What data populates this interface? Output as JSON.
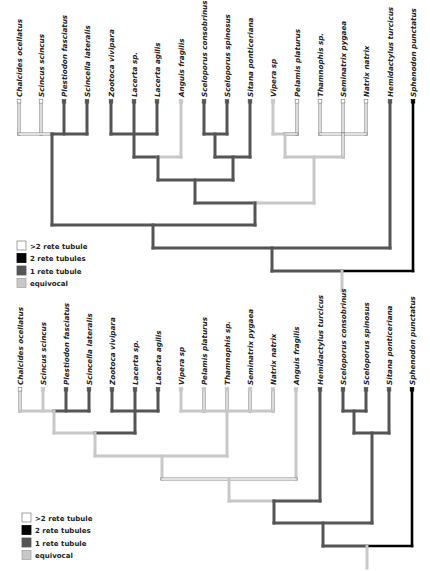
{
  "figure": {
    "caption_fragment": "...ology and ... of ... rete tubule ... (cropped header)",
    "states": {
      "gt2": {
        "label": ">2 rete tubule",
        "color": "#ffffff",
        "stroke": "#8a8a8a"
      },
      "two": {
        "label": "2 rete tubules",
        "color": "#000000",
        "stroke": "#000000"
      },
      "one": {
        "label": "1 rete tubule",
        "color": "#555555",
        "stroke": "#555555"
      },
      "equivocal": {
        "label": "equivocal",
        "color": "#c8c8c8",
        "stroke": "#c8c8c8"
      }
    },
    "legend_order": [
      "gt2",
      "two",
      "one",
      "equivocal"
    ],
    "panels": [
      {
        "id": "top",
        "tip_y": 103,
        "label_y": 100,
        "legend": {
          "x": 17,
          "y": 241
        },
        "root": {
          "x": 341,
          "y": 288
        },
        "taxa": [
          {
            "name": "Chalcides ocellatus",
            "x": 19,
            "state": "gt2"
          },
          {
            "name": "Scincus scincus",
            "x": 41,
            "state": "gt2"
          },
          {
            "name": "Plestiodon fasciatus",
            "x": 64,
            "state": "one"
          },
          {
            "name": "Scincella lateralis",
            "x": 87,
            "state": "one"
          },
          {
            "name": "Zootoca vivipara",
            "x": 111,
            "state": "one"
          },
          {
            "name": "Lacerta sp.",
            "x": 134,
            "state": "one"
          },
          {
            "name": "Lacerta agilis",
            "x": 157,
            "state": "one"
          },
          {
            "name": "Anguis fragilis",
            "x": 181,
            "state": "equivocal"
          },
          {
            "name": "Sceloporus consobrinus",
            "x": 204,
            "state": "one"
          },
          {
            "name": "Sceloporus spinosus",
            "x": 227,
            "state": "one"
          },
          {
            "name": "Sitana ponticeriana",
            "x": 250,
            "state": "one"
          },
          {
            "name": "Vipera sp",
            "x": 273,
            "state": "equivocal"
          },
          {
            "name": "Pelamis platurus",
            "x": 297,
            "state": "gt2"
          },
          {
            "name": "Thamnophis sp.",
            "x": 320,
            "state": "gt2"
          },
          {
            "name": "Seminatrix pygaea",
            "x": 343,
            "state": "gt2"
          },
          {
            "name": "Natrix natrix",
            "x": 366,
            "state": "gt2"
          },
          {
            "name": "Hemidactylus turcicus",
            "x": 390,
            "state": "one"
          },
          {
            "name": "Sphenodon punctatus",
            "x": 413,
            "state": "two"
          }
        ],
        "edges": [
          {
            "x1": 19,
            "y1": 103,
            "x2": 19,
            "y2": 134,
            "s": "gt2"
          },
          {
            "x1": 41,
            "y1": 103,
            "x2": 41,
            "y2": 134,
            "s": "gt2"
          },
          {
            "x1": 19,
            "y1": 134,
            "x2": 52,
            "y2": 134,
            "s": "gt2"
          },
          {
            "x1": 64,
            "y1": 103,
            "x2": 64,
            "y2": 134,
            "s": "one"
          },
          {
            "x1": 87,
            "y1": 103,
            "x2": 87,
            "y2": 134,
            "s": "one"
          },
          {
            "x1": 52,
            "y1": 134,
            "x2": 87,
            "y2": 134,
            "s": "one"
          },
          {
            "x1": 52,
            "y1": 134,
            "x2": 52,
            "y2": 225,
            "s": "one"
          },
          {
            "x1": 111,
            "y1": 103,
            "x2": 111,
            "y2": 134,
            "s": "one"
          },
          {
            "x1": 157,
            "y1": 103,
            "x2": 157,
            "y2": 134,
            "s": "one"
          },
          {
            "x1": 111,
            "y1": 134,
            "x2": 157,
            "y2": 134,
            "s": "one"
          },
          {
            "x1": 134,
            "y1": 103,
            "x2": 134,
            "y2": 157,
            "s": "one"
          },
          {
            "x1": 181,
            "y1": 103,
            "x2": 181,
            "y2": 157,
            "s": "equivocal"
          },
          {
            "x1": 134,
            "y1": 157,
            "x2": 158,
            "y2": 157,
            "s": "one"
          },
          {
            "x1": 158,
            "y1": 157,
            "x2": 181,
            "y2": 157,
            "s": "equivocal"
          },
          {
            "x1": 158,
            "y1": 157,
            "x2": 158,
            "y2": 180,
            "s": "one"
          },
          {
            "x1": 204,
            "y1": 103,
            "x2": 204,
            "y2": 134,
            "s": "one"
          },
          {
            "x1": 227,
            "y1": 103,
            "x2": 227,
            "y2": 134,
            "s": "one"
          },
          {
            "x1": 204,
            "y1": 134,
            "x2": 227,
            "y2": 134,
            "s": "one"
          },
          {
            "x1": 215,
            "y1": 134,
            "x2": 215,
            "y2": 157,
            "s": "one"
          },
          {
            "x1": 250,
            "y1": 103,
            "x2": 250,
            "y2": 157,
            "s": "one"
          },
          {
            "x1": 215,
            "y1": 157,
            "x2": 250,
            "y2": 157,
            "s": "one"
          },
          {
            "x1": 233,
            "y1": 157,
            "x2": 233,
            "y2": 180,
            "s": "one"
          },
          {
            "x1": 158,
            "y1": 180,
            "x2": 233,
            "y2": 180,
            "s": "one"
          },
          {
            "x1": 195,
            "y1": 180,
            "x2": 195,
            "y2": 203,
            "s": "one"
          },
          {
            "x1": 273,
            "y1": 103,
            "x2": 273,
            "y2": 134,
            "s": "equivocal"
          },
          {
            "x1": 297,
            "y1": 103,
            "x2": 297,
            "y2": 134,
            "s": "gt2"
          },
          {
            "x1": 273,
            "y1": 134,
            "x2": 285,
            "y2": 134,
            "s": "equivocal"
          },
          {
            "x1": 285,
            "y1": 134,
            "x2": 297,
            "y2": 134,
            "s": "gt2"
          },
          {
            "x1": 320,
            "y1": 103,
            "x2": 320,
            "y2": 134,
            "s": "gt2"
          },
          {
            "x1": 343,
            "y1": 103,
            "x2": 343,
            "y2": 134,
            "s": "gt2"
          },
          {
            "x1": 366,
            "y1": 103,
            "x2": 366,
            "y2": 134,
            "s": "gt2"
          },
          {
            "x1": 320,
            "y1": 134,
            "x2": 366,
            "y2": 134,
            "s": "gt2"
          },
          {
            "x1": 285,
            "y1": 134,
            "x2": 285,
            "y2": 157,
            "s": "equivocal"
          },
          {
            "x1": 343,
            "y1": 134,
            "x2": 343,
            "y2": 157,
            "s": "gt2"
          },
          {
            "x1": 285,
            "y1": 157,
            "x2": 343,
            "y2": 157,
            "s": "equivocal"
          },
          {
            "x1": 314,
            "y1": 157,
            "x2": 314,
            "y2": 203,
            "s": "equivocal"
          },
          {
            "x1": 195,
            "y1": 203,
            "x2": 255,
            "y2": 203,
            "s": "one"
          },
          {
            "x1": 255,
            "y1": 203,
            "x2": 314,
            "y2": 203,
            "s": "equivocal"
          },
          {
            "x1": 255,
            "y1": 203,
            "x2": 255,
            "y2": 225,
            "s": "one"
          },
          {
            "x1": 52,
            "y1": 225,
            "x2": 255,
            "y2": 225,
            "s": "one"
          },
          {
            "x1": 153,
            "y1": 225,
            "x2": 153,
            "y2": 248,
            "s": "one"
          },
          {
            "x1": 390,
            "y1": 103,
            "x2": 390,
            "y2": 248,
            "s": "one"
          },
          {
            "x1": 153,
            "y1": 248,
            "x2": 390,
            "y2": 248,
            "s": "one"
          },
          {
            "x1": 272,
            "y1": 248,
            "x2": 272,
            "y2": 271,
            "s": "one"
          },
          {
            "x1": 413,
            "y1": 103,
            "x2": 413,
            "y2": 271,
            "s": "two"
          },
          {
            "x1": 272,
            "y1": 271,
            "x2": 342,
            "y2": 271,
            "s": "one"
          },
          {
            "x1": 342,
            "y1": 271,
            "x2": 413,
            "y2": 271,
            "s": "two"
          },
          {
            "x1": 342,
            "y1": 271,
            "x2": 342,
            "y2": 291,
            "s": "equivocal"
          }
        ]
      },
      {
        "id": "bottom",
        "tip_y": 391,
        "label_y": 388,
        "legend": {
          "x": 22,
          "y": 513
        },
        "root": {
          "x": 367,
          "y": 568
        },
        "taxa": [
          {
            "name": "Chalcides ocellatus",
            "x": 20,
            "state": "gt2"
          },
          {
            "name": "Scincus scincus",
            "x": 43,
            "state": "equivocal"
          },
          {
            "name": "Plestiodon fasciatus",
            "x": 66,
            "state": "one"
          },
          {
            "name": "Scincella lateralis",
            "x": 89,
            "state": "one"
          },
          {
            "name": "Zootoca vivipara",
            "x": 112,
            "state": "one"
          },
          {
            "name": "Lacerta sp.",
            "x": 135,
            "state": "one"
          },
          {
            "name": "Lacerta agilis",
            "x": 158,
            "state": "one"
          },
          {
            "name": "Vipera sp",
            "x": 181,
            "state": "equivocal"
          },
          {
            "name": "Pelamis platurus",
            "x": 204,
            "state": "equivocal"
          },
          {
            "name": "Thamnophis sp.",
            "x": 227,
            "state": "equivocal"
          },
          {
            "name": "Seminatrix pygaea",
            "x": 250,
            "state": "equivocal"
          },
          {
            "name": "Natrix natrix",
            "x": 273,
            "state": "equivocal"
          },
          {
            "name": "Anguis fragilis",
            "x": 296,
            "state": "equivocal"
          },
          {
            "name": "Hemidactylus turcicus",
            "x": 320,
            "state": "one"
          },
          {
            "name": "Sceloporus consobrinus",
            "x": 343,
            "state": "one"
          },
          {
            "name": "Sceloporus spinosus",
            "x": 366,
            "state": "one"
          },
          {
            "name": "Sitana ponticeriana",
            "x": 389,
            "state": "one"
          },
          {
            "name": "Sphenodon punctatus",
            "x": 412,
            "state": "two"
          }
        ],
        "edges": [
          {
            "x1": 20,
            "y1": 391,
            "x2": 20,
            "y2": 411,
            "s": "gt2"
          },
          {
            "x1": 43,
            "y1": 391,
            "x2": 43,
            "y2": 411,
            "s": "equivocal"
          },
          {
            "x1": 20,
            "y1": 411,
            "x2": 54,
            "y2": 411,
            "s": "equivocal"
          },
          {
            "x1": 66,
            "y1": 391,
            "x2": 66,
            "y2": 411,
            "s": "one"
          },
          {
            "x1": 89,
            "y1": 391,
            "x2": 89,
            "y2": 411,
            "s": "one"
          },
          {
            "x1": 54,
            "y1": 411,
            "x2": 89,
            "y2": 411,
            "s": "one"
          },
          {
            "x1": 54,
            "y1": 411,
            "x2": 54,
            "y2": 433,
            "s": "equivocal"
          },
          {
            "x1": 112,
            "y1": 391,
            "x2": 112,
            "y2": 411,
            "s": "one"
          },
          {
            "x1": 158,
            "y1": 391,
            "x2": 158,
            "y2": 411,
            "s": "one"
          },
          {
            "x1": 112,
            "y1": 411,
            "x2": 158,
            "y2": 411,
            "s": "one"
          },
          {
            "x1": 135,
            "y1": 391,
            "x2": 135,
            "y2": 433,
            "s": "one"
          },
          {
            "x1": 54,
            "y1": 433,
            "x2": 95,
            "y2": 433,
            "s": "equivocal"
          },
          {
            "x1": 95,
            "y1": 433,
            "x2": 135,
            "y2": 433,
            "s": "one"
          },
          {
            "x1": 95,
            "y1": 433,
            "x2": 95,
            "y2": 456,
            "s": "equivocal"
          },
          {
            "x1": 181,
            "y1": 391,
            "x2": 181,
            "y2": 411,
            "s": "equivocal"
          },
          {
            "x1": 204,
            "y1": 391,
            "x2": 204,
            "y2": 411,
            "s": "gt2"
          },
          {
            "x1": 227,
            "y1": 391,
            "x2": 227,
            "y2": 411,
            "s": "gt2"
          },
          {
            "x1": 250,
            "y1": 391,
            "x2": 250,
            "y2": 411,
            "s": "gt2"
          },
          {
            "x1": 273,
            "y1": 391,
            "x2": 273,
            "y2": 411,
            "s": "gt2"
          },
          {
            "x1": 181,
            "y1": 411,
            "x2": 273,
            "y2": 411,
            "s": "equivocal"
          },
          {
            "x1": 227,
            "y1": 411,
            "x2": 227,
            "y2": 456,
            "s": "equivocal"
          },
          {
            "x1": 95,
            "y1": 456,
            "x2": 227,
            "y2": 456,
            "s": "equivocal"
          },
          {
            "x1": 162,
            "y1": 456,
            "x2": 162,
            "y2": 479,
            "s": "equivocal"
          },
          {
            "x1": 296,
            "y1": 391,
            "x2": 296,
            "y2": 479,
            "s": "equivocal"
          },
          {
            "x1": 162,
            "y1": 479,
            "x2": 296,
            "y2": 479,
            "s": "gt2"
          },
          {
            "x1": 229,
            "y1": 479,
            "x2": 229,
            "y2": 501,
            "s": "equivocal"
          },
          {
            "x1": 320,
            "y1": 391,
            "x2": 320,
            "y2": 501,
            "s": "one"
          },
          {
            "x1": 229,
            "y1": 501,
            "x2": 274,
            "y2": 501,
            "s": "equivocal"
          },
          {
            "x1": 274,
            "y1": 501,
            "x2": 320,
            "y2": 501,
            "s": "one"
          },
          {
            "x1": 274,
            "y1": 501,
            "x2": 274,
            "y2": 523,
            "s": "one"
          },
          {
            "x1": 343,
            "y1": 391,
            "x2": 343,
            "y2": 411,
            "s": "one"
          },
          {
            "x1": 366,
            "y1": 391,
            "x2": 366,
            "y2": 411,
            "s": "one"
          },
          {
            "x1": 343,
            "y1": 411,
            "x2": 366,
            "y2": 411,
            "s": "one"
          },
          {
            "x1": 354,
            "y1": 411,
            "x2": 354,
            "y2": 433,
            "s": "one"
          },
          {
            "x1": 389,
            "y1": 391,
            "x2": 389,
            "y2": 433,
            "s": "one"
          },
          {
            "x1": 354,
            "y1": 433,
            "x2": 389,
            "y2": 433,
            "s": "one"
          },
          {
            "x1": 372,
            "y1": 433,
            "x2": 372,
            "y2": 523,
            "s": "one"
          },
          {
            "x1": 274,
            "y1": 523,
            "x2": 372,
            "y2": 523,
            "s": "one"
          },
          {
            "x1": 323,
            "y1": 523,
            "x2": 323,
            "y2": 546,
            "s": "one"
          },
          {
            "x1": 412,
            "y1": 391,
            "x2": 412,
            "y2": 546,
            "s": "two"
          },
          {
            "x1": 323,
            "y1": 546,
            "x2": 367,
            "y2": 546,
            "s": "one"
          },
          {
            "x1": 367,
            "y1": 546,
            "x2": 412,
            "y2": 546,
            "s": "two"
          },
          {
            "x1": 367,
            "y1": 546,
            "x2": 367,
            "y2": 568,
            "s": "equivocal"
          }
        ]
      }
    ]
  }
}
